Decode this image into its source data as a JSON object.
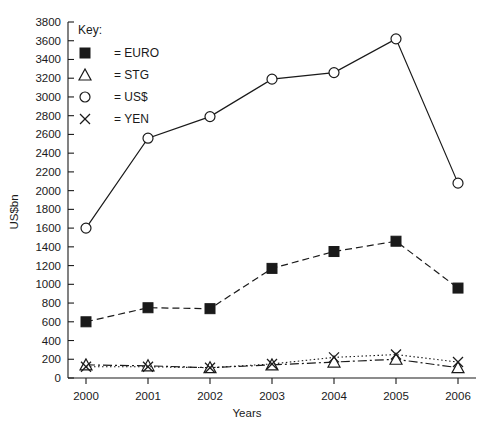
{
  "chart_data": {
    "type": "line",
    "title": "",
    "xlabel": "Years",
    "ylabel": "US$bn",
    "categories": [
      "2000",
      "2001",
      "2002",
      "2003",
      "2004",
      "2005",
      "2006"
    ],
    "x": [
      2000,
      2001,
      2002,
      2003,
      2004,
      2005,
      2006
    ],
    "ylim": [
      0,
      3800
    ],
    "ytick_step": 200,
    "yticks": [
      0,
      200,
      400,
      600,
      800,
      1000,
      1200,
      1400,
      1600,
      1800,
      2000,
      2200,
      2400,
      2600,
      2800,
      3000,
      3200,
      3400,
      3600,
      3800
    ],
    "grid": false,
    "legend_position": "top-left-inside",
    "legend_title": "Key:",
    "series": [
      {
        "name": "EURO",
        "marker": "filled-square",
        "line_style": "dashed",
        "values": [
          600,
          750,
          740,
          1170,
          1350,
          1460,
          960
        ]
      },
      {
        "name": "STG",
        "marker": "open-triangle",
        "line_style": "dash-dot",
        "values": [
          140,
          130,
          110,
          140,
          170,
          200,
          110
        ]
      },
      {
        "name": "US$",
        "marker": "open-circle",
        "line_style": "solid",
        "values": [
          1600,
          2560,
          2790,
          3190,
          3260,
          3620,
          2080
        ]
      },
      {
        "name": "YEN",
        "marker": "cross",
        "line_style": "dotted",
        "values": [
          120,
          120,
          110,
          150,
          220,
          250,
          170
        ]
      }
    ]
  },
  "legend": {
    "title": "Key:",
    "entries": [
      {
        "marker": "filled-square",
        "equals": "=",
        "label": "EURO"
      },
      {
        "marker": "open-triangle",
        "equals": "=",
        "label": "STG"
      },
      {
        "marker": "open-circle",
        "equals": "=",
        "label": "US$"
      },
      {
        "marker": "cross",
        "equals": "=",
        "label": "YEN"
      }
    ]
  },
  "axes": {
    "y_title": "US$bn",
    "x_title": "Years"
  },
  "colors": {
    "ink": "#1a1a1a",
    "background": "#ffffff"
  }
}
